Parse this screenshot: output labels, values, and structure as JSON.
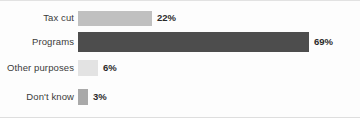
{
  "chart_data": {
    "type": "bar",
    "orientation": "horizontal",
    "title": "",
    "subtitle": "",
    "xlabel": "",
    "ylabel": "",
    "xlim": [
      0,
      100
    ],
    "grid": false,
    "legend": null,
    "value_suffix": "%",
    "categories": [
      "Tax cut",
      "Programs",
      "Other purposes",
      "Don't know"
    ],
    "values": [
      22,
      69,
      6,
      3
    ],
    "data_labels": [
      "22%",
      "69%",
      "6%",
      "3%"
    ],
    "bar_colors": [
      "#c0c0c0",
      "#4d4d4d",
      "#e3e3e3",
      "#a9a9a9"
    ],
    "series": [
      {
        "name": "Share of respondents",
        "values": [
          22,
          69,
          6,
          3
        ]
      }
    ],
    "points": [
      {
        "category": "Tax cut",
        "value": 22,
        "label": "22%",
        "color": "#c0c0c0"
      },
      {
        "category": "Programs",
        "value": 69,
        "label": "69%",
        "color": "#4d4d4d"
      },
      {
        "category": "Other purposes",
        "value": 6,
        "label": "6%",
        "color": "#e3e3e3"
      },
      {
        "category": "Don't know",
        "value": 3,
        "label": "3%",
        "color": "#a9a9a9"
      }
    ]
  }
}
